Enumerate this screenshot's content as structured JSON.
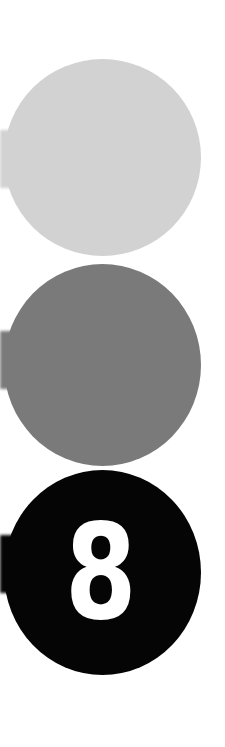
{
  "graphic": {
    "description": "Vertical stack of three circles with small tabs on the left edge",
    "circles": [
      {
        "position": "top",
        "color": "#d2d2d2",
        "label": ""
      },
      {
        "position": "middle",
        "color": "#7a7a7a",
        "label": ""
      },
      {
        "position": "bottom",
        "color": "#050505",
        "label": "8",
        "label_color": "#ffffff"
      }
    ]
  }
}
